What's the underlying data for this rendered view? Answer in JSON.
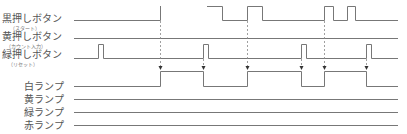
{
  "inputs": [
    {
      "label": "黒押しボタン",
      "sublabel": "（スタート）"
    },
    {
      "label": "黄押しボタン",
      "sublabel": "（カウント入力）"
    },
    {
      "label": "緑押しボタン",
      "sublabel": "（リセット）"
    }
  ],
  "outputs": [
    {
      "label": "白ランプ"
    },
    {
      "label": "黄ランプ"
    },
    {
      "label": "緑ランプ"
    },
    {
      "label": "赤ランプ"
    }
  ],
  "colors": {
    "line": "#777777",
    "dashed": "#888888"
  },
  "timing": {
    "black_button_pulses": [
      [
        160,
        160
      ],
      [
        208,
        222
      ],
      [
        247,
        262
      ],
      [
        324,
        333
      ],
      [
        347,
        355
      ]
    ],
    "green_button_pulses": [
      [
        98,
        103
      ],
      [
        203,
        208
      ],
      [
        301,
        306
      ],
      [
        366,
        371
      ]
    ],
    "white_lamp_transitions": [
      160,
      203,
      247,
      301,
      324,
      366
    ],
    "trigger_markers_x": [
      160,
      203,
      247,
      301,
      324,
      366
    ]
  }
}
